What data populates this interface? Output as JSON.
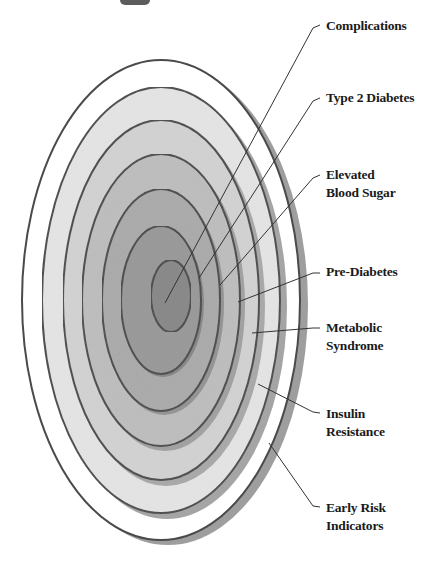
{
  "diagram": {
    "type": "concentric-ellipse-progression",
    "colors": {
      "ring_stroke": "#4a4a4a",
      "shadow": "#9a9a9a",
      "leader_line": "#333333",
      "label_text": "#1a1a1a",
      "fills": [
        "#ffffff",
        "#e2e2e2",
        "#cfcfcf",
        "#bcbcbc",
        "#a8a8a8",
        "#969696",
        "#858585"
      ]
    },
    "layers": [
      {
        "id": "early-risk-indicators",
        "label": "Early Risk Indicators",
        "lines": [
          "Early Risk",
          "Indicators"
        ],
        "order": 1
      },
      {
        "id": "insulin-resistance",
        "label": "Insulin Resistance",
        "lines": [
          "Insulin",
          "Resistance"
        ],
        "order": 2
      },
      {
        "id": "metabolic-syndrome",
        "label": "Metabolic Syndrome",
        "lines": [
          "Metabolic",
          "Syndrome"
        ],
        "order": 3
      },
      {
        "id": "pre-diabetes",
        "label": "Pre-Diabetes",
        "lines": [
          "Pre-Diabetes"
        ],
        "order": 4
      },
      {
        "id": "elevated-blood-sugar",
        "label": "Elevated Blood Sugar",
        "lines": [
          "Elevated",
          "Blood Sugar"
        ],
        "order": 5
      },
      {
        "id": "type-2-diabetes",
        "label": "Type 2 Diabetes",
        "lines": [
          "Type 2 Diabetes"
        ],
        "order": 6
      },
      {
        "id": "complications",
        "label": "Complications",
        "lines": [
          "Complications"
        ],
        "order": 7
      }
    ]
  }
}
